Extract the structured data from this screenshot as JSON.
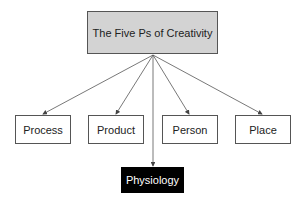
{
  "diagram": {
    "root": {
      "label": "The Five Ps of Creativity",
      "fill": "#d3d3d3"
    },
    "children": [
      {
        "label": "Process"
      },
      {
        "label": "Product"
      },
      {
        "label": "Person"
      },
      {
        "label": "Place"
      }
    ],
    "bottom": {
      "label": "Physiology",
      "fill": "#000000",
      "text_color": "#ffffff"
    }
  }
}
